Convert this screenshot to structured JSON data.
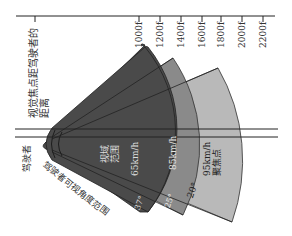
{
  "axis": {
    "title_line1": "视觉焦点距驾驶者的",
    "title_line2": "距离",
    "ticks": [
      "1000f",
      "1200f",
      "1400f",
      "1600f",
      "1800f",
      "2000f",
      "2200f"
    ]
  },
  "labels": {
    "driver": "驾驶者",
    "driver_view_range": "驾驶者可视角度范围",
    "view_range_line1": "视域",
    "view_range_line2": "范围",
    "speed_65": "65km/h",
    "speed_85": "85km/h",
    "speed_95": "95km/h",
    "focus_point": "聚焦点",
    "angle_37": "37°",
    "angle_25": "25°",
    "angle_20": "20°"
  },
  "colors": {
    "wedge_dark": "#4a4a4a",
    "wedge_mid": "#8a8a8a",
    "wedge_light": "#b9b9b9",
    "line": "#222222",
    "text_on_dark": "#e6e6e6"
  }
}
